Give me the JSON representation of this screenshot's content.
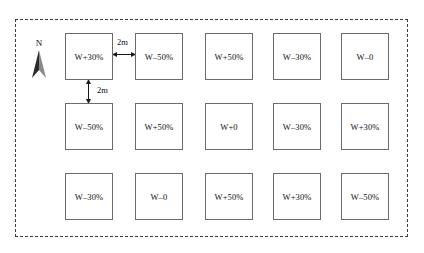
{
  "figure": {
    "boundary_style": "dashed",
    "north_marker": {
      "label": "N",
      "icon": "north-arrow-icon"
    },
    "dimensions": {
      "horizontal_gap": "2m",
      "vertical_gap": "2m"
    },
    "grid": {
      "rows": 3,
      "columns": 5,
      "plots": [
        [
          {
            "label": "W+30%"
          },
          {
            "label": "W–50%"
          },
          {
            "label": "W+50%"
          },
          {
            "label": "W–30%"
          },
          {
            "label": "W–0"
          }
        ],
        [
          {
            "label": "W–50%"
          },
          {
            "label": "W+50%"
          },
          {
            "label": "W+0"
          },
          {
            "label": "W–30%"
          },
          {
            "label": "W+30%"
          }
        ],
        [
          {
            "label": "W–30%"
          },
          {
            "label": "W–0"
          },
          {
            "label": "W+50%"
          },
          {
            "label": "W+30%"
          },
          {
            "label": "W–50%"
          }
        ]
      ]
    },
    "colors": {
      "boundary": "#3a3a3a",
      "plot_border": "#6b6b6b",
      "text": "#111111",
      "background": "#ffffff"
    }
  }
}
